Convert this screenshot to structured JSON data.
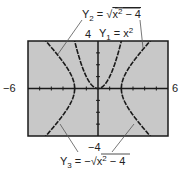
{
  "chart_data": {
    "type": "line",
    "title": "",
    "xlabel": "",
    "ylabel": "",
    "xlim": [
      -6,
      6
    ],
    "ylim": [
      -4,
      4
    ],
    "x_tick_step": 1,
    "y_tick_step": 1,
    "grid": false,
    "legend": "callout annotations",
    "tick_labels": {
      "x_min": "−6",
      "x_max": "6",
      "y_min": "−4",
      "y_max": "4"
    },
    "series": [
      {
        "name": "Y1",
        "expression": "x^2",
        "label": "Y₁ = x²",
        "domain": [
          -2.1,
          2.1
        ]
      },
      {
        "name": "Y2",
        "expression": "sqrt(x^2 - 4)",
        "label": "Y₂ = √(x² − 4)",
        "domain": "|x| >= 2"
      },
      {
        "name": "Y3",
        "expression": "-sqrt(x^2 - 4)",
        "label": "Y₃ = −√(x² − 4)",
        "domain": "|x| >= 2"
      }
    ]
  },
  "colors": {
    "plot_background": "#c8c8c8",
    "curve": "#1a1a1a",
    "frame": "#1a1a1a",
    "leader_line": "#555555"
  }
}
